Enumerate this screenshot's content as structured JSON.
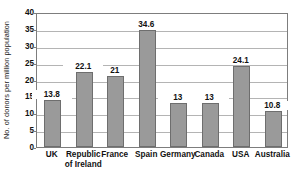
{
  "chart_data": {
    "type": "bar",
    "title": "",
    "xlabel": "",
    "ylabel": "No. of donors per million population",
    "ylim": [
      0,
      40
    ],
    "yticks": [
      0,
      5,
      10,
      15,
      20,
      25,
      30,
      35,
      40
    ],
    "grid": true,
    "legend": false,
    "categories": [
      "UK",
      "Republic of Ireland",
      "France",
      "Spain",
      "Germany",
      "Canada",
      "USA",
      "Australia"
    ],
    "category_lines": [
      [
        "UK"
      ],
      [
        "Republic",
        "of Ireland"
      ],
      [
        "France"
      ],
      [
        "Spain"
      ],
      [
        "Germany"
      ],
      [
        "Canada"
      ],
      [
        "USA"
      ],
      [
        "Australia"
      ]
    ],
    "values": [
      13.8,
      22.1,
      21,
      34.6,
      13,
      13,
      24.1,
      10.8
    ],
    "value_labels": [
      "13.8",
      "22.1",
      "21",
      "34.6",
      "13",
      "13",
      "24.1",
      "10.8"
    ],
    "bar_color": "#9a9a9a",
    "bar_border_color": "#6e6e6e",
    "grid_color": "#b4b4b4",
    "axis_color": "#7d7d7d",
    "text_color": "#111111",
    "background": "#ffffff"
  }
}
